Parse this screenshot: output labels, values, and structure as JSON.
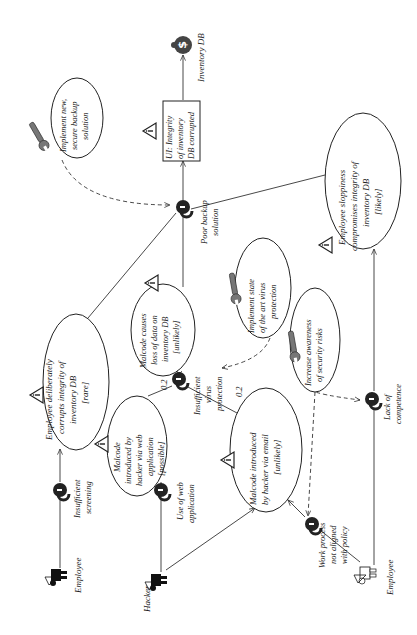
{
  "diagram": {
    "type": "CORAS treatment diagram",
    "orientation": "rotated -90deg",
    "asset": {
      "label": "Inventory DB",
      "icon": "money-bag-icon"
    },
    "unwanted_incident": {
      "lines": [
        "UI: Integrity",
        "of inventory",
        "DB corrupted"
      ]
    },
    "threat_scenarios": [
      {
        "id": "employee-deliberately",
        "lines": [
          "Employee deliberately",
          "corrupts integrity of",
          "inventory DB",
          "[rare]"
        ]
      },
      {
        "id": "malcode-loss",
        "lines": [
          "Malcode causes",
          "loss of data on",
          "inventory DB",
          "[unlikely]"
        ]
      },
      {
        "id": "employee-sloppiness",
        "lines": [
          "Employee sloppiness",
          "compromises integrity of",
          "inventory DB",
          "[likely]"
        ]
      },
      {
        "id": "malcode-web",
        "lines": [
          "Malcode",
          "introduced by",
          "hacker via web",
          "application",
          "[possible]"
        ]
      },
      {
        "id": "malcode-email",
        "lines": [
          "Malcode introduced",
          "by hacker via email",
          "[unlikely]"
        ]
      }
    ],
    "treatments": [
      {
        "id": "backup-treatment",
        "lines": [
          "Implement new,",
          "secure backup",
          "solution"
        ]
      },
      {
        "id": "virus-treatment",
        "lines": [
          "Implement state",
          "of the art virus",
          "protection"
        ]
      },
      {
        "id": "awareness-treatment",
        "lines": [
          "Increase awareness",
          "of security risks"
        ]
      }
    ],
    "vulnerabilities": [
      {
        "id": "poor-backup",
        "lines": [
          "Poor backup",
          "solution"
        ]
      },
      {
        "id": "insufficient-virus",
        "lines": [
          "Insufficient",
          "virus",
          "protection"
        ]
      },
      {
        "id": "lack-competence",
        "lines": [
          "Lack of",
          "competence"
        ]
      },
      {
        "id": "work-process",
        "lines": [
          "Work process",
          "not aligned",
          "with policy"
        ]
      },
      {
        "id": "insufficient-screening",
        "lines": [
          "Insufficient",
          "screening"
        ]
      },
      {
        "id": "use-web-app",
        "lines": [
          "Use of web",
          "application"
        ]
      }
    ],
    "threats": [
      {
        "id": "employee-deliberate",
        "label": "Employee",
        "icon": "deliberate-human-threat-icon"
      },
      {
        "id": "hacker",
        "label": "Hacker",
        "icon": "deliberate-human-threat-icon"
      },
      {
        "id": "employee-accidental",
        "label": "Employee",
        "icon": "accidental-human-threat-icon"
      }
    ],
    "edge_labels": {
      "web_to_virus": "0.2",
      "email_to_virus": "0.2"
    },
    "colors": {
      "line": "#333333",
      "lock": "#222222",
      "wrench": "#666666"
    }
  }
}
